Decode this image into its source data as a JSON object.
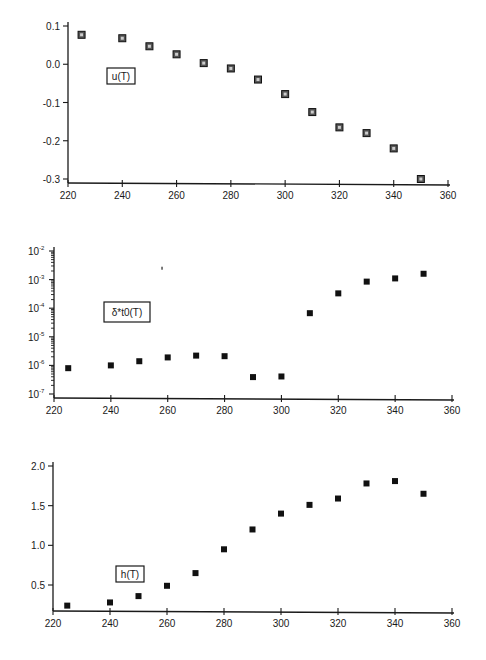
{
  "chart_data": [
    {
      "type": "scatter",
      "title": "",
      "label": "u(T)",
      "xlabel": "",
      "ylabel": "",
      "xlim": [
        220,
        360
      ],
      "ylim": [
        -0.3,
        0.1
      ],
      "xticks": [
        220,
        240,
        260,
        280,
        300,
        320,
        340,
        360
      ],
      "xtick_labels": [
        "220",
        "240",
        "260",
        "280",
        "300",
        "320",
        "340",
        "360"
      ],
      "yticks": [
        0.1,
        0.0,
        -0.1,
        -0.2,
        -0.3
      ],
      "ytick_labels": [
        "0.1",
        "0.0",
        "-0.1",
        "-0.2",
        "-0.3"
      ],
      "yscale": "linear",
      "marker": "boxed-square",
      "grid": false,
      "legend": "none",
      "x": [
        225,
        240,
        250,
        260,
        270,
        280,
        290,
        300,
        310,
        320,
        330,
        340,
        350
      ],
      "y": [
        0.077,
        0.068,
        0.047,
        0.026,
        0.003,
        -0.011,
        -0.04,
        -0.078,
        -0.125,
        -0.165,
        -0.18,
        -0.22,
        -0.3
      ]
    },
    {
      "type": "scatter",
      "title": "",
      "label": "δ*t0(T)",
      "xlabel": "",
      "ylabel": "",
      "xlim": [
        220,
        360
      ],
      "ylim": [
        1e-07,
        0.01
      ],
      "xticks": [
        220,
        240,
        260,
        280,
        300,
        320,
        340,
        360
      ],
      "xtick_labels": [
        "220",
        "240",
        "260",
        "280",
        "300",
        "320",
        "340",
        "360"
      ],
      "yticks": [
        0.01,
        0.001,
        0.0001,
        1e-05,
        1e-06,
        1e-07
      ],
      "ytick_labels": [
        {
          "base": "10",
          "exp": "-2"
        },
        {
          "base": "10",
          "exp": "-3"
        },
        {
          "base": "10",
          "exp": "-4"
        },
        {
          "base": "10",
          "exp": "-5"
        },
        {
          "base": "10",
          "exp": "-6"
        },
        {
          "base": "10",
          "exp": "-7"
        }
      ],
      "yscale": "log",
      "marker": "filled-square",
      "grid": false,
      "legend": "none",
      "x": [
        225,
        240,
        250,
        260,
        270,
        280,
        290,
        300,
        310,
        320,
        330,
        340,
        350
      ],
      "y": [
        8e-07,
        1e-06,
        1.4e-06,
        1.9e-06,
        2.2e-06,
        2.1e-06,
        3.9e-07,
        4.1e-07,
        6.7e-05,
        0.00033,
        0.00085,
        0.0011,
        0.0016
      ],
      "stray_mark": {
        "x": 258,
        "y": 0.0025
      }
    },
    {
      "type": "scatter",
      "title": "",
      "label": "h(T)",
      "xlabel": "",
      "ylabel": "",
      "xlim": [
        220,
        360
      ],
      "ylim": [
        0.17,
        2.0
      ],
      "xticks": [
        220,
        240,
        260,
        280,
        300,
        320,
        340,
        360
      ],
      "xtick_labels": [
        "220",
        "240",
        "260",
        "280",
        "300",
        "320",
        "340",
        "360"
      ],
      "yticks": [
        2.0,
        1.5,
        1.0,
        0.5
      ],
      "ytick_labels": [
        "2.0",
        "1.5",
        "1.0",
        "0.5"
      ],
      "yscale": "linear",
      "marker": "filled-square",
      "grid": false,
      "legend": "none",
      "x": [
        225,
        240,
        250,
        260,
        270,
        280,
        290,
        300,
        310,
        320,
        330,
        340,
        350
      ],
      "y": [
        0.24,
        0.28,
        0.36,
        0.49,
        0.65,
        0.95,
        1.2,
        1.4,
        1.51,
        1.59,
        1.78,
        1.81,
        1.65
      ]
    }
  ]
}
